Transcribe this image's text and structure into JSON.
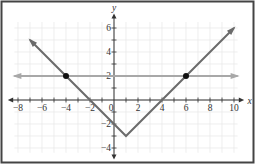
{
  "chart_data": {
    "type": "line",
    "title": "",
    "xlabel": "x",
    "ylabel": "y",
    "xlim": [
      -8.5,
      10.5
    ],
    "ylim": [
      -4.5,
      7
    ],
    "x_ticks": [
      -8,
      -6,
      -4,
      -2,
      0,
      2,
      4,
      6,
      8,
      10
    ],
    "x_tick_labels": [
      "−8",
      "−6",
      "−4",
      "−2",
      "0",
      "2",
      "4",
      "6",
      "8",
      "10"
    ],
    "y_ticks": [
      -4,
      -2,
      2,
      4,
      6
    ],
    "y_tick_labels": [
      "−4",
      "−2",
      "2",
      "4",
      "6"
    ],
    "grid": true,
    "series": [
      {
        "name": "f(x) = |x − 1| − 3",
        "color": "#6b6b6b",
        "x": [
          -7,
          1,
          10
        ],
        "y": [
          5,
          -3,
          6
        ]
      },
      {
        "name": "y = 2",
        "color": "#a8a8a8",
        "x": [
          -8.3,
          10.3
        ],
        "y": [
          2,
          2
        ]
      }
    ],
    "points": [
      {
        "x": -4,
        "y": 2
      },
      {
        "x": 6,
        "y": 2
      }
    ]
  },
  "colors": {
    "axis": "#333333",
    "grid": "#e6e6e6",
    "border": "#444444",
    "point": "#111111"
  }
}
